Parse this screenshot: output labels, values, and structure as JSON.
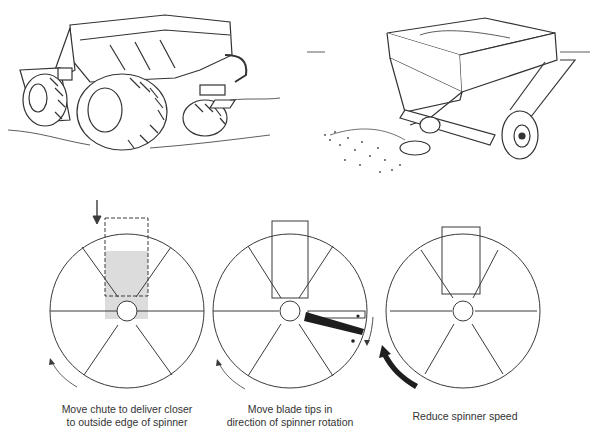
{
  "illustrations": {
    "top_left": "self-propelled spreader with flotation tires",
    "top_right": "pull-type spinner spreader trailer"
  },
  "panels": [
    {
      "caption_line1": "Move chute to deliver closer",
      "caption_line2": "to outside edge of spinner"
    },
    {
      "caption_line1": "Move blade tips in",
      "caption_line2": "direction of spinner rotation"
    },
    {
      "caption_line1": "Reduce spinner speed",
      "caption_line2": ""
    }
  ],
  "colors": {
    "line": "#3a3a3a",
    "fill_dark": "#1e1e1e",
    "shade": "#d8d8d8"
  }
}
